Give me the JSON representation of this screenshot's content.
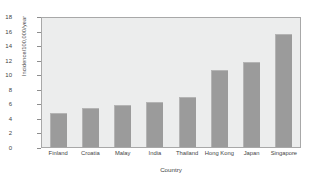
{
  "chart_data": {
    "type": "bar",
    "title": "",
    "xlabel": "Country",
    "ylabel": "Incidence/100,000/year",
    "categories": [
      "Finland",
      "Croatia",
      "Malay",
      "India",
      "Thailand",
      "Hong Kong",
      "Japan",
      "Singapore"
    ],
    "values": [
      4.7,
      5.5,
      5.9,
      6.3,
      7.0,
      10.7,
      11.8,
      15.7
    ],
    "ylim": [
      0,
      18
    ],
    "yticks": [
      0,
      2,
      4,
      6,
      8,
      10,
      12,
      14,
      16,
      18
    ],
    "grid": false,
    "legend": "none",
    "bar_color": "#9b9b9b",
    "plot_background": "#eceded",
    "frame_color": "#a8a8a8"
  }
}
